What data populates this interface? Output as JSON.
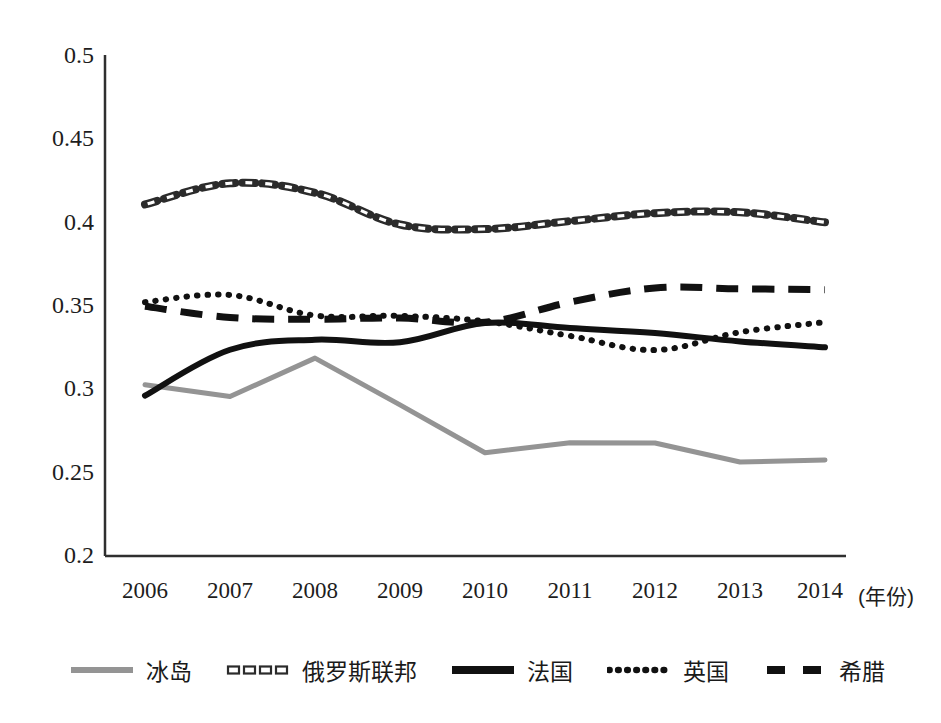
{
  "chart_data": {
    "type": "line",
    "title": "",
    "subtitle": "",
    "xlabel": "(年份)",
    "ylabel": "",
    "x": [
      2006,
      2007,
      2008,
      2009,
      2010,
      2011,
      2012,
      2013,
      2014
    ],
    "categories": [
      "2006",
      "2007",
      "2008",
      "2009",
      "2010",
      "2011",
      "2012",
      "2013",
      "2014"
    ],
    "xlim": [
      2006,
      2014
    ],
    "ylim": [
      0.2,
      0.5
    ],
    "yticks": [
      0.2,
      0.25,
      0.3,
      0.35,
      0.4,
      0.45,
      0.5
    ],
    "ytick_labels": [
      "0.2",
      "0.25",
      "0.3",
      "0.35",
      "0.4",
      "0.45",
      "0.5"
    ],
    "grid": false,
    "legend_position": "bottom",
    "series": [
      {
        "name": "冰岛",
        "style": "solid",
        "color": "#949494",
        "width": 5,
        "values": [
          0.3025,
          0.2955,
          0.3185,
          0.2905,
          0.2618,
          0.2678,
          0.2677,
          0.2563,
          0.2575
        ]
      },
      {
        "name": "俄罗斯联邦",
        "style": "hollow-dash",
        "color": "#2b2b2b",
        "width": 4,
        "values": [
          0.4105,
          0.4232,
          0.4175,
          0.3985,
          0.3958,
          0.4005,
          0.4053,
          0.4058,
          0.3998
        ]
      },
      {
        "name": "法国",
        "style": "solid",
        "color": "#111111",
        "width": 6,
        "values": [
          0.296,
          0.3235,
          0.3295,
          0.328,
          0.3395,
          0.3365,
          0.3335,
          0.3285,
          0.325
        ]
      },
      {
        "name": "英国",
        "style": "dotted",
        "color": "#111111",
        "width": 6,
        "values": [
          0.352,
          0.3563,
          0.344,
          0.3438,
          0.3405,
          0.3318,
          0.3233,
          0.334,
          0.34
        ]
      },
      {
        "name": "希腊",
        "style": "dashed",
        "color": "#111111",
        "width": 7,
        "values": [
          0.3495,
          0.3428,
          0.3418,
          0.3425,
          0.34,
          0.352,
          0.3605,
          0.36,
          0.3595
        ]
      }
    ]
  },
  "axes": {
    "y_labels": [
      "0.5",
      "0.45",
      "0.4",
      "0.35",
      "0.3",
      "0.25",
      "0.2"
    ],
    "x_labels": [
      "2006",
      "2007",
      "2008",
      "2009",
      "2010",
      "2011",
      "2012",
      "2013",
      "2014"
    ],
    "x_axis_title": "(年份)"
  },
  "legend": {
    "items": [
      {
        "label": "冰岛"
      },
      {
        "label": "俄罗斯联邦"
      },
      {
        "label": "法国"
      },
      {
        "label": "英国"
      },
      {
        "label": "希腊"
      }
    ]
  }
}
